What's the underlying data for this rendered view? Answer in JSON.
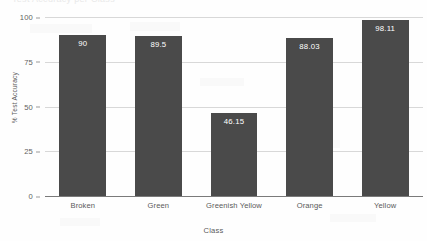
{
  "figure": {
    "clipped_title": "Test Accuracy per Class",
    "background_color": "#fefefe",
    "bar_color": "#4a4a4a",
    "gridline_color": "#d8d8d8",
    "axis_color": "#7a7a7a",
    "value_label_color": "#ffffff"
  },
  "chart_data": {
    "type": "bar",
    "title": "",
    "xlabel": "Class",
    "ylabel": "% Test Accuracy",
    "categories": [
      "Broken",
      "Green",
      "Greenish Yellow",
      "Orange",
      "Yellow"
    ],
    "values": [
      90,
      89.5,
      46.15,
      88.03,
      98.11
    ],
    "value_labels": [
      "90",
      "89.5",
      "46.15",
      "88.03",
      "98.11"
    ],
    "ylim": [
      0,
      100
    ],
    "yticks": [
      0,
      25,
      50,
      75,
      100
    ],
    "ytick_labels": [
      "0",
      "25",
      "50",
      "75",
      "100"
    ],
    "grid": true,
    "legend": false,
    "legend_position": "none",
    "orientation": "vertical",
    "series": [
      {
        "name": "% Test Accuracy",
        "values": [
          90,
          89.5,
          46.15,
          88.03,
          98.11
        ]
      }
    ]
  }
}
